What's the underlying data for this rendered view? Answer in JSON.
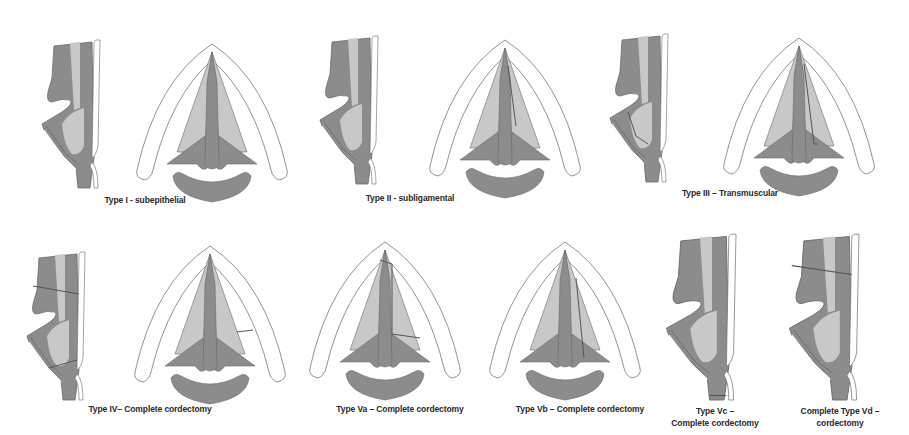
{
  "figure": {
    "colors": {
      "muscle_dark": "#8c8c8c",
      "tissue_light": "#c8c8c8",
      "cartilage_fill": "#ffffff",
      "outline": "#6a6a6a",
      "resection_line": "#555555",
      "background": "#ffffff"
    },
    "panels": [
      {
        "id": "type-i",
        "label": "Type I - subepithelial",
        "views": [
          "coronal-section",
          "axial-glottis"
        ]
      },
      {
        "id": "type-ii",
        "label": "Type II - subligamental",
        "views": [
          "coronal-section",
          "axial-glottis"
        ]
      },
      {
        "id": "type-iii",
        "label": "Type III – Transmuscular",
        "views": [
          "coronal-section",
          "axial-glottis"
        ]
      },
      {
        "id": "type-iv",
        "label": "Type IV– Complete cordectomy",
        "views": [
          "coronal-section",
          "axial-glottis"
        ]
      },
      {
        "id": "type-va",
        "label": "Type Va – Complete cordectomy",
        "views": [
          "axial-glottis"
        ]
      },
      {
        "id": "type-vb",
        "label": "Type Vb – Complete cordectomy",
        "views": [
          "axial-glottis"
        ]
      },
      {
        "id": "type-vc",
        "label_line1": "Type Vc –",
        "label_line2": "Complete cordectomy",
        "views": [
          "coronal-section"
        ]
      },
      {
        "id": "type-vd",
        "label_line1": "Complete Type Vd –",
        "label_line2": "cordectomy",
        "views": [
          "coronal-section"
        ]
      }
    ]
  }
}
